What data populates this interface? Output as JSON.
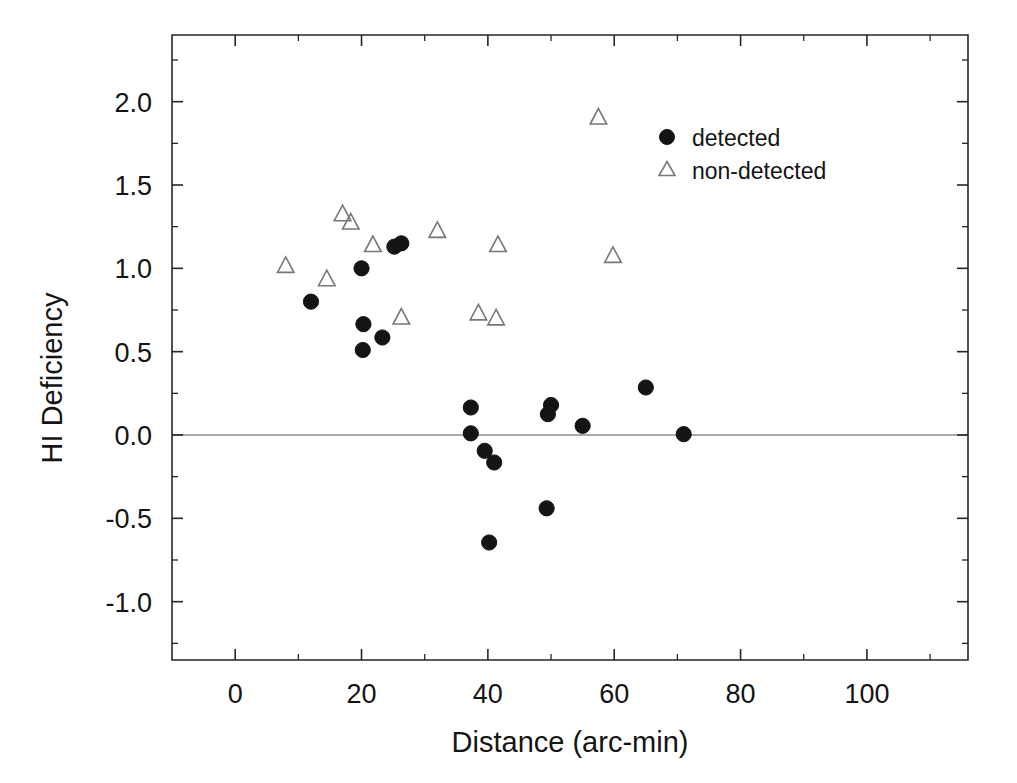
{
  "chart_data": {
    "type": "scatter",
    "title": "",
    "xlabel": "Distance (arc-min)",
    "ylabel": "HI Deficiency",
    "xlim": [
      -10,
      116
    ],
    "ylim": [
      -1.35,
      2.4
    ],
    "xticks": [
      0,
      20,
      40,
      60,
      80,
      100
    ],
    "xtick_labels": [
      "0",
      "20",
      "40",
      "60",
      "80",
      "100"
    ],
    "xticks_minor": [
      10,
      30,
      50,
      70,
      90,
      110
    ],
    "yticks": [
      -1.0,
      -0.5,
      0.0,
      0.5,
      1.0,
      1.5,
      2.0
    ],
    "ytick_labels": [
      "-1.0",
      "-0.5",
      "0.0",
      "0.5",
      "1.0",
      "1.5",
      "2.0"
    ],
    "yticks_minor": [
      -1.25,
      -0.75,
      -0.25,
      0.25,
      0.75,
      1.25,
      1.75,
      2.25
    ],
    "grid": false,
    "reference_lines": [
      {
        "orientation": "horizontal",
        "value": 0.0,
        "color": "#555555"
      }
    ],
    "legend_position": "top-right",
    "series": [
      {
        "name": "detected",
        "marker": "filled-circle",
        "color": "#141414",
        "points": [
          {
            "x": 12.0,
            "y": 0.8
          },
          {
            "x": 20.0,
            "y": 1.0
          },
          {
            "x": 20.3,
            "y": 0.665
          },
          {
            "x": 20.2,
            "y": 0.51
          },
          {
            "x": 23.3,
            "y": 0.585
          },
          {
            "x": 25.2,
            "y": 1.13
          },
          {
            "x": 26.3,
            "y": 1.15
          },
          {
            "x": 37.3,
            "y": 0.165
          },
          {
            "x": 37.3,
            "y": 0.01
          },
          {
            "x": 39.5,
            "y": -0.095
          },
          {
            "x": 41.0,
            "y": -0.165
          },
          {
            "x": 40.2,
            "y": -0.645
          },
          {
            "x": 49.3,
            "y": -0.44
          },
          {
            "x": 49.5,
            "y": 0.125
          },
          {
            "x": 50.0,
            "y": 0.18
          },
          {
            "x": 55.0,
            "y": 0.055
          },
          {
            "x": 65.0,
            "y": 0.285
          },
          {
            "x": 71.0,
            "y": 0.005
          }
        ]
      },
      {
        "name": "non-detected",
        "marker": "open-triangle",
        "color": "#777777",
        "points": [
          {
            "x": 8.0,
            "y": 1.015
          },
          {
            "x": 14.5,
            "y": 0.935
          },
          {
            "x": 17.0,
            "y": 1.325
          },
          {
            "x": 18.3,
            "y": 1.275
          },
          {
            "x": 21.8,
            "y": 1.14
          },
          {
            "x": 26.3,
            "y": 0.705
          },
          {
            "x": 32.0,
            "y": 1.225
          },
          {
            "x": 38.5,
            "y": 0.73
          },
          {
            "x": 41.3,
            "y": 0.7
          },
          {
            "x": 41.6,
            "y": 1.14
          },
          {
            "x": 57.5,
            "y": 1.905
          },
          {
            "x": 59.8,
            "y": 1.075
          }
        ]
      }
    ]
  },
  "legend": {
    "entries": [
      {
        "label": "detected",
        "marker": "filled-circle"
      },
      {
        "label": "non-detected",
        "marker": "open-triangle"
      }
    ]
  },
  "colors": {
    "detected": "#141414",
    "non_detected": "#777777",
    "axis": "#262626",
    "zero_line": "#555555",
    "background": "#ffffff"
  }
}
